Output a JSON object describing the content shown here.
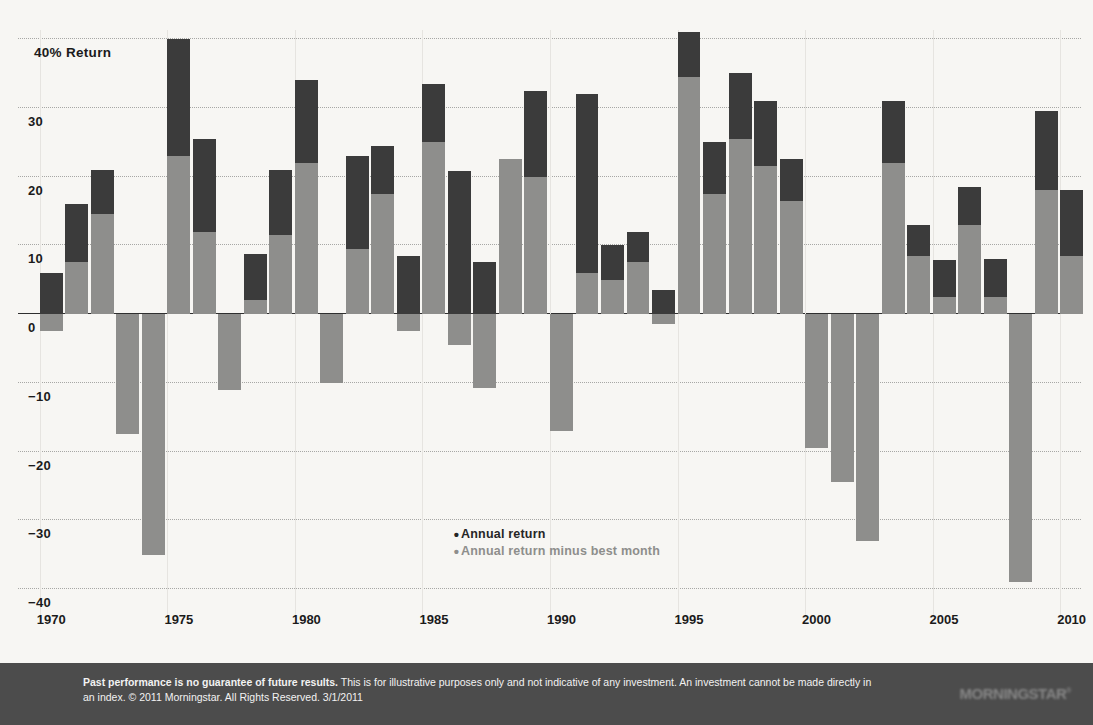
{
  "chart_data": {
    "type": "bar",
    "title": "",
    "xlabel": "",
    "ylabel": "40% Return",
    "ylim": [
      -40,
      40
    ],
    "xlim": [
      1969.3,
      2010.7
    ],
    "grid": true,
    "legend_position": "center",
    "yticks": [
      "40% Return",
      "30",
      "20",
      "10",
      "0",
      "−10",
      "−20",
      "−30",
      "−40"
    ],
    "ytick_values": [
      40,
      30,
      20,
      10,
      0,
      -10,
      -20,
      -30,
      -40
    ],
    "xticks": [
      "1970",
      "1975",
      "1980",
      "1985",
      "1990",
      "1995",
      "2000",
      "2005",
      "2010"
    ],
    "xtick_values": [
      1970,
      1975,
      1980,
      1985,
      1990,
      1995,
      2000,
      2005,
      2010
    ],
    "categories": [
      1970,
      1971,
      1972,
      1973,
      1974,
      1975,
      1976,
      1977,
      1978,
      1979,
      1980,
      1981,
      1982,
      1983,
      1984,
      1985,
      1986,
      1987,
      1988,
      1989,
      1990,
      1991,
      1992,
      1993,
      1994,
      1995,
      1996,
      1997,
      1998,
      1999,
      2000,
      2001,
      2002,
      2003,
      2004,
      2005,
      2006,
      2007,
      2008,
      2009,
      2010
    ],
    "series": [
      {
        "name": "Annual return",
        "color": "#3b3b3b",
        "values": [
          6.0,
          16.0,
          21.0,
          -13.0,
          -23.0,
          40.0,
          25.5,
          -9.5,
          8.8,
          21.0,
          34.0,
          -4.5,
          23.0,
          24.5,
          8.5,
          33.5,
          20.8,
          7.5,
          19.0,
          32.5,
          -10.5,
          32.0,
          10.0,
          12.0,
          3.5,
          41.0,
          25.0,
          35.0,
          31.0,
          22.5,
          -15.5,
          -17.5,
          -25.5,
          31.0,
          13.0,
          7.8,
          18.5,
          8.0,
          -37.0,
          29.5,
          18.0
        ]
      },
      {
        "name": "Annual return minus best month",
        "color": "#8e8e8c",
        "values": [
          -2.5,
          7.5,
          14.5,
          -17.5,
          -35.0,
          23.0,
          12.0,
          -11.0,
          2.0,
          11.5,
          22.0,
          -10.0,
          9.5,
          17.5,
          -2.5,
          25.0,
          -4.5,
          -10.8,
          22.5,
          20.0,
          -17.0,
          6.0,
          5.0,
          7.5,
          -1.5,
          34.5,
          17.5,
          25.5,
          21.5,
          16.5,
          -19.5,
          -24.5,
          -33.0,
          22.0,
          8.5,
          2.5,
          13.0,
          2.5,
          -39.0,
          18.0,
          8.5
        ]
      }
    ],
    "legend": [
      {
        "label": "Annual return",
        "marker": "•",
        "color": "#262626"
      },
      {
        "label": "Annual return minus best month",
        "marker": "•",
        "color": "#8e8e8c"
      }
    ]
  },
  "footer": {
    "bold_lead": "Past performance is no guarantee of future results.",
    "body": " This is for illustrative purposes only and not indicative of any investment. An investment cannot be made directly in an index. © 2011 Morningstar. All Rights Reserved. 3/1/2011",
    "logo": "MORNINGSTAR",
    "logo_mark": "®",
    "background_color": "#4c4c4c",
    "text_color": "#f2f2f2"
  },
  "style": {
    "plot_background": "#f7f6f3",
    "gridline_color": "#9a9a98",
    "axis_color": "#2f2f2f"
  }
}
